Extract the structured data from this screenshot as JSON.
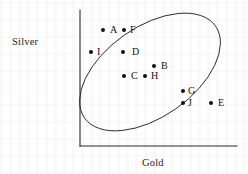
{
  "figure": {
    "type": "scatter-with-cluster-boundary",
    "background_color": "#ffffff",
    "ink_color": "#111111"
  },
  "axes": {
    "y_label": "Silver",
    "x_label": "Gold",
    "origin": {
      "x": 80,
      "y": 146
    },
    "y_axis_top": 10,
    "x_axis_right": 237,
    "ticks": [],
    "gridlines": false
  },
  "cluster_boundary": {
    "shape": "ellipse",
    "center_x": 150,
    "center_y": 72,
    "radius_x": 80,
    "radius_y": 45,
    "rotation_deg": -35,
    "stroke_color": "#2b2b2b",
    "stroke_width": 0.9
  },
  "chart_data": {
    "type": "scatter",
    "title": "",
    "xlabel": "Gold",
    "ylabel": "Silver",
    "xlim": [
      0,
      1
    ],
    "ylim": [
      0,
      1
    ],
    "grid": false,
    "legend": "none",
    "annotation": "Points A-J form an inverse (negative) Gold-Silver relationship enclosed by an ellipse; E lies on the boundary.",
    "point_labels": [
      "A",
      "F",
      "I",
      "D",
      "B",
      "C",
      "H",
      "G",
      "J",
      "E"
    ],
    "points": [
      {
        "label": "A",
        "px": 103,
        "py": 30,
        "x": 0.15,
        "y": 0.88,
        "label_dx": 7,
        "label_dy": -5,
        "inside_ellipse": true
      },
      {
        "label": "F",
        "px": 124,
        "py": 30,
        "x": 0.28,
        "y": 0.88,
        "label_dx": 6,
        "label_dy": -5,
        "inside_ellipse": true
      },
      {
        "label": "I",
        "px": 91,
        "py": 52,
        "x": 0.07,
        "y": 0.72,
        "label_dx": 6,
        "label_dy": -5,
        "inside_ellipse": true
      },
      {
        "label": "D",
        "px": 123,
        "py": 52,
        "x": 0.27,
        "y": 0.72,
        "label_dx": 9,
        "label_dy": -5,
        "inside_ellipse": true
      },
      {
        "label": "B",
        "px": 154,
        "py": 66,
        "x": 0.47,
        "y": 0.61,
        "label_dx": 7,
        "label_dy": -5,
        "inside_ellipse": true
      },
      {
        "label": "C",
        "px": 124,
        "py": 76,
        "x": 0.28,
        "y": 0.53,
        "label_dx": 7,
        "label_dy": -5,
        "inside_ellipse": true
      },
      {
        "label": "H",
        "px": 145,
        "py": 76,
        "x": 0.41,
        "y": 0.53,
        "label_dx": 6,
        "label_dy": -5,
        "inside_ellipse": true
      },
      {
        "label": "G",
        "px": 183,
        "py": 91,
        "x": 0.65,
        "y": 0.4,
        "label_dx": 5,
        "label_dy": -5,
        "inside_ellipse": true
      },
      {
        "label": "J",
        "px": 183,
        "py": 103,
        "x": 0.65,
        "y": 0.31,
        "label_dx": 5,
        "label_dy": -5,
        "inside_ellipse": true
      },
      {
        "label": "E",
        "px": 211,
        "py": 103,
        "x": 0.83,
        "y": 0.31,
        "label_dx": 7,
        "label_dy": -5,
        "inside_ellipse": false
      }
    ]
  }
}
